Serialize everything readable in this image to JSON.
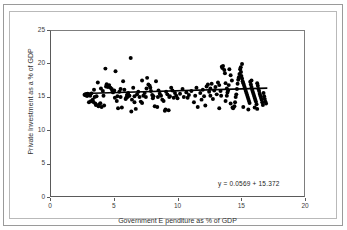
{
  "page": {
    "title_faint": "",
    "background": "#ffffff",
    "border_color": "#9a9a9a"
  },
  "chart_data": {
    "type": "scatter",
    "title": "",
    "xlabel": "Government E penditure as % of GDP",
    "ylabel": "Private Investment as a % of GDP",
    "xlim": [
      0,
      20
    ],
    "ylim": [
      0,
      25
    ],
    "xticks": [
      0,
      5,
      10,
      15,
      20
    ],
    "yticks": [
      0,
      5,
      10,
      15,
      20,
      25
    ],
    "grid": false,
    "legend": null,
    "marker_color": "#000000",
    "marker_size": 2.0,
    "trendline": {
      "type": "linear",
      "slope": 0.0569,
      "intercept": 15.372,
      "color": "#000000",
      "width": 1.6,
      "x_start": 2.6,
      "x_end": 17.1,
      "label": "y = 0.0569  + 15.372"
    },
    "annotations": [
      {
        "text": "y = 0.0569  + 15.372",
        "x": 14.6,
        "y": 2.1
      }
    ],
    "points": [
      [
        2.65,
        15.35
      ],
      [
        2.72,
        15.25
      ],
      [
        2.78,
        15.45
      ],
      [
        2.85,
        15.15
      ],
      [
        2.9,
        15.5
      ],
      [
        2.95,
        15.3
      ],
      [
        3.0,
        14.2
      ],
      [
        3.05,
        15.4
      ],
      [
        3.1,
        15.2
      ],
      [
        3.15,
        14.35
      ],
      [
        3.2,
        15.55
      ],
      [
        3.3,
        14.6
      ],
      [
        3.35,
        14.25
      ],
      [
        3.4,
        16.1
      ],
      [
        3.5,
        14.0
      ],
      [
        3.55,
        13.8
      ],
      [
        3.6,
        15.1
      ],
      [
        3.7,
        17.2
      ],
      [
        3.75,
        13.6
      ],
      [
        3.8,
        13.85
      ],
      [
        3.9,
        14.05
      ],
      [
        3.95,
        16.3
      ],
      [
        4.0,
        13.5
      ],
      [
        4.1,
        15.9
      ],
      [
        4.2,
        13.7
      ],
      [
        4.3,
        19.3
      ],
      [
        4.35,
        16.6
      ],
      [
        4.4,
        16.95
      ],
      [
        4.5,
        16.5
      ],
      [
        4.6,
        16.8
      ],
      [
        4.7,
        16.4
      ],
      [
        4.8,
        16.2
      ],
      [
        4.85,
        15.95
      ],
      [
        4.9,
        15.7
      ],
      [
        5.0,
        16.0
      ],
      [
        5.05,
        14.9
      ],
      [
        5.1,
        18.9
      ],
      [
        5.2,
        14.4
      ],
      [
        5.25,
        15.1
      ],
      [
        5.3,
        13.3
      ],
      [
        5.4,
        15.8
      ],
      [
        5.5,
        15.0
      ],
      [
        5.6,
        13.4
      ],
      [
        5.7,
        17.4
      ],
      [
        5.8,
        16.1
      ],
      [
        5.9,
        14.7
      ],
      [
        5.95,
        14.9
      ],
      [
        6.0,
        15.3
      ],
      [
        6.05,
        15.0
      ],
      [
        6.1,
        15.6
      ],
      [
        6.2,
        15.2
      ],
      [
        6.3,
        20.9
      ],
      [
        6.35,
        12.8
      ],
      [
        6.4,
        14.6
      ],
      [
        6.5,
        16.4
      ],
      [
        6.6,
        15.1
      ],
      [
        6.7,
        13.2
      ],
      [
        6.8,
        15.4
      ],
      [
        6.9,
        15.8
      ],
      [
        7.0,
        15.0
      ],
      [
        7.1,
        14.3
      ],
      [
        7.2,
        17.5
      ],
      [
        7.3,
        15.2
      ],
      [
        7.4,
        15.6
      ],
      [
        7.5,
        15.0
      ],
      [
        7.55,
        16.3
      ],
      [
        7.6,
        17.9
      ],
      [
        7.7,
        16.9
      ],
      [
        7.8,
        16.7
      ],
      [
        7.85,
        16.4
      ],
      [
        7.9,
        15.9
      ],
      [
        8.0,
        15.3
      ],
      [
        8.05,
        14.8
      ],
      [
        8.1,
        15.1
      ],
      [
        8.2,
        13.6
      ],
      [
        8.3,
        17.4
      ],
      [
        8.4,
        13.5
      ],
      [
        8.5,
        16.0
      ],
      [
        8.6,
        15.5
      ],
      [
        8.7,
        15.2
      ],
      [
        8.8,
        14.6
      ],
      [
        8.9,
        14.4
      ],
      [
        9.0,
        12.9
      ],
      [
        9.05,
        13.1
      ],
      [
        9.1,
        15.8
      ],
      [
        9.2,
        15.4
      ],
      [
        9.3,
        13.0
      ],
      [
        9.4,
        15.1
      ],
      [
        9.5,
        16.4
      ],
      [
        9.6,
        16.0
      ],
      [
        9.7,
        14.9
      ],
      [
        9.8,
        15.6
      ],
      [
        9.9,
        15.2
      ],
      [
        10.0,
        14.8
      ],
      [
        10.2,
        15.5
      ],
      [
        10.4,
        16.2
      ],
      [
        10.5,
        15.0
      ],
      [
        10.7,
        15.7
      ],
      [
        10.9,
        15.3
      ],
      [
        11.1,
        15.9
      ],
      [
        11.3,
        14.2
      ],
      [
        11.4,
        15.2
      ],
      [
        11.5,
        16.4
      ],
      [
        11.6,
        13.5
      ],
      [
        11.8,
        15.6
      ],
      [
        12.0,
        16.1
      ],
      [
        12.1,
        15.1
      ],
      [
        12.3,
        16.6
      ],
      [
        12.4,
        16.9
      ],
      [
        12.5,
        15.8
      ],
      [
        12.6,
        16.3
      ],
      [
        12.7,
        17.0
      ],
      [
        12.8,
        14.7
      ],
      [
        12.9,
        16.0
      ],
      [
        13.0,
        16.5
      ],
      [
        13.1,
        15.4
      ],
      [
        13.2,
        17.2
      ],
      [
        13.3,
        16.8
      ],
      [
        13.4,
        15.9
      ],
      [
        13.5,
        19.6
      ],
      [
        13.55,
        19.4
      ],
      [
        13.6,
        19.7
      ],
      [
        13.7,
        19.1
      ],
      [
        13.75,
        18.6
      ],
      [
        13.8,
        17.1
      ],
      [
        13.9,
        16.3
      ],
      [
        13.95,
        15.7
      ],
      [
        14.0,
        16.0
      ],
      [
        14.05,
        16.8
      ],
      [
        14.1,
        19.2
      ],
      [
        14.2,
        18.3
      ],
      [
        14.3,
        17.5
      ],
      [
        14.4,
        13.3
      ],
      [
        14.5,
        13.6
      ],
      [
        14.55,
        14.2
      ],
      [
        14.6,
        15.0
      ],
      [
        14.7,
        16.2
      ],
      [
        14.75,
        17.0
      ],
      [
        14.8,
        17.6
      ],
      [
        14.85,
        18.0
      ],
      [
        14.9,
        18.5
      ],
      [
        14.95,
        19.2
      ],
      [
        15.0,
        19.5
      ],
      [
        15.02,
        18.8
      ],
      [
        15.05,
        18.2
      ],
      [
        15.1,
        17.8
      ],
      [
        15.15,
        17.4
      ],
      [
        15.2,
        17.1
      ],
      [
        15.25,
        16.8
      ],
      [
        15.3,
        16.5
      ],
      [
        15.35,
        16.2
      ],
      [
        15.4,
        15.9
      ],
      [
        15.45,
        15.6
      ],
      [
        15.5,
        15.3
      ],
      [
        15.55,
        15.0
      ],
      [
        15.6,
        14.7
      ],
      [
        15.65,
        14.4
      ],
      [
        15.7,
        14.1
      ],
      [
        15.75,
        17.3
      ],
      [
        15.8,
        16.9
      ],
      [
        15.85,
        16.5
      ],
      [
        15.9,
        16.1
      ],
      [
        15.95,
        15.8
      ],
      [
        16.0,
        15.5
      ],
      [
        16.05,
        15.2
      ],
      [
        16.1,
        14.9
      ],
      [
        16.15,
        14.6
      ],
      [
        16.2,
        14.3
      ],
      [
        16.25,
        13.9
      ],
      [
        16.3,
        13.2
      ],
      [
        16.35,
        16.7
      ],
      [
        16.4,
        16.2
      ],
      [
        16.45,
        15.9
      ],
      [
        16.5,
        15.5
      ],
      [
        16.55,
        15.2
      ],
      [
        16.6,
        14.9
      ],
      [
        16.65,
        14.6
      ],
      [
        16.7,
        14.2
      ],
      [
        16.75,
        13.8
      ],
      [
        16.8,
        15.6
      ],
      [
        16.85,
        15.1
      ],
      [
        16.9,
        14.7
      ],
      [
        16.95,
        14.3
      ],
      [
        17.0,
        14.0
      ],
      [
        14.2,
        14.0
      ],
      [
        14.35,
        13.4
      ],
      [
        13.3,
        13.3
      ],
      [
        13.8,
        14.4
      ],
      [
        12.2,
        13.7
      ],
      [
        15.2,
        13.5
      ],
      [
        15.6,
        13.1
      ],
      [
        16.1,
        13.4
      ],
      [
        12.6,
        15.2
      ],
      [
        11.9,
        14.6
      ],
      [
        13.45,
        15.2
      ],
      [
        14.65,
        15.4
      ],
      [
        15.85,
        17.5
      ],
      [
        16.3,
        17.1
      ],
      [
        15.1,
        20.0
      ],
      [
        13.9,
        15.2
      ],
      [
        7.2,
        14.1
      ],
      [
        6.6,
        14.2
      ],
      [
        5.5,
        16.2
      ],
      [
        4.15,
        15.2
      ],
      [
        3.45,
        15.0
      ],
      [
        9.35,
        15.0
      ],
      [
        10.8,
        14.9
      ],
      [
        8.45,
        15.0
      ]
    ]
  },
  "axis": {
    "y_ticks": [
      "0",
      "5",
      "10",
      "15",
      "20",
      "25"
    ],
    "x_ticks": [
      "0",
      "5",
      "10",
      "15",
      "20"
    ]
  }
}
